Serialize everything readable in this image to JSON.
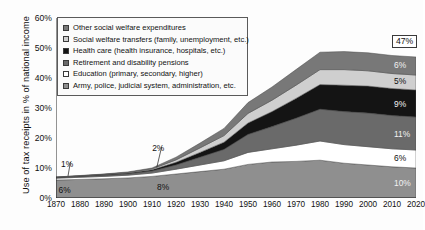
{
  "chart_data": {
    "type": "area",
    "title": "",
    "xlabel": "",
    "ylabel": "Use of tax receipts in % of national income",
    "xlim": [
      1870,
      2020
    ],
    "ylim": [
      0,
      60
    ],
    "grid": false,
    "legend_position": "upper-left-inside",
    "stacked": true,
    "x": [
      1870,
      1880,
      1890,
      1900,
      1910,
      1920,
      1930,
      1940,
      1950,
      1960,
      1970,
      1980,
      1990,
      2000,
      2010,
      2020
    ],
    "xtick_labels": [
      "1870",
      "1880",
      "1890",
      "1900",
      "1910",
      "1920",
      "1930",
      "1940",
      "1950",
      "1960",
      "1970",
      "1980",
      "1990",
      "2000",
      "2010",
      "2020"
    ],
    "ytick_labels": [
      "0%",
      "10%",
      "20%",
      "30%",
      "40%",
      "50%",
      "60%"
    ],
    "ytick_values": [
      0,
      10,
      20,
      30,
      40,
      50,
      60
    ],
    "series": [
      {
        "name": "Army, police, judicial system, administration, etc.",
        "color": "#8f8f8f",
        "values": [
          6.0,
          6.2,
          6.4,
          6.7,
          7.2,
          8.0,
          8.8,
          9.6,
          11.2,
          12.0,
          12.2,
          12.6,
          11.6,
          11.0,
          10.4,
          10.0
        ]
      },
      {
        "name": "Education (primary, secondary, higher)",
        "color": "#ffffff",
        "values": [
          0.6,
          0.7,
          0.8,
          0.9,
          1.1,
          1.6,
          2.2,
          2.8,
          4.0,
          4.4,
          5.4,
          6.4,
          6.2,
          6.1,
          6.0,
          6.0
        ]
      },
      {
        "name": "Retirement and disability pensions",
        "color": "#6a6a6a",
        "values": [
          0.2,
          0.3,
          0.4,
          0.5,
          0.7,
          1.4,
          2.6,
          3.8,
          6.0,
          7.4,
          9.0,
          10.6,
          11.0,
          11.2,
          11.1,
          11.0
        ]
      },
      {
        "name": "Health care (health insurance, hospitals, etc.)",
        "color": "#141414",
        "values": [
          0.1,
          0.1,
          0.2,
          0.2,
          0.4,
          0.9,
          1.6,
          2.4,
          3.8,
          5.0,
          6.6,
          8.2,
          8.8,
          9.0,
          9.0,
          9.0
        ]
      },
      {
        "name": "Social welfare transfers (family, unemployment, etc.)",
        "color": "#cfcfcf",
        "values": [
          0.05,
          0.1,
          0.1,
          0.2,
          0.3,
          0.8,
          1.5,
          2.2,
          3.2,
          3.8,
          4.4,
          5.0,
          5.2,
          5.1,
          5.0,
          5.0
        ]
      },
      {
        "name": "Other social welfare expenditures",
        "color": "#787878",
        "values": [
          0.05,
          0.1,
          0.1,
          0.2,
          0.3,
          0.9,
          1.6,
          2.4,
          3.6,
          4.4,
          5.2,
          5.8,
          6.0,
          6.0,
          6.0,
          6.0
        ]
      }
    ],
    "totals": [
      7.0,
      7.5,
      8.0,
      8.7,
      10.0,
      13.6,
      18.3,
      23.2,
      31.8,
      37.0,
      42.8,
      47.6,
      48.8,
      48.4,
      47.5,
      47.0
    ],
    "annotations": [
      {
        "name": "left-total-1875",
        "text": "1%",
        "x": 1875,
        "y": 11.5
      },
      {
        "name": "left-base-1875",
        "text": "6%",
        "x": 1874,
        "y": 2.6
      },
      {
        "name": "left-total-1910",
        "text": "2%",
        "x": 1913,
        "y": 16.8
      },
      {
        "name": "left-base-1910",
        "text": "8%",
        "x": 1915,
        "y": 3.6
      },
      {
        "name": "total-2020-boxed",
        "text": "47%",
        "x": 2020,
        "y": 52.5,
        "boxed": true
      },
      {
        "name": "band-other-2020",
        "text": "6%",
        "x": 2020,
        "y": 44.5
      },
      {
        "name": "band-transfers-2020",
        "text": "5%",
        "x": 2020,
        "y": 39.0
      },
      {
        "name": "band-health-2020",
        "text": "9%",
        "x": 2020,
        "y": 31.5
      },
      {
        "name": "band-pensions-2020",
        "text": "11%",
        "x": 2020,
        "y": 21.5
      },
      {
        "name": "band-education-2020",
        "text": "6%",
        "x": 2020,
        "y": 13.2
      },
      {
        "name": "band-army-2020",
        "text": "10%",
        "x": 2020,
        "y": 5.0
      }
    ]
  },
  "legend": {
    "items": [
      {
        "label": "Other social welfare expenditures",
        "color": "#787878"
      },
      {
        "label": "Social welfare transfers (family, unemployment, etc.)",
        "color": "#cfcfcf"
      },
      {
        "label": "Health care (health insurance, hospitals, etc.)",
        "color": "#141414"
      },
      {
        "label": "Retirement and disability pensions",
        "color": "#6a6a6a"
      },
      {
        "label": "Education (primary, secondary, higher)",
        "color": "#ffffff"
      },
      {
        "label": "Army, police, judicial system, administration, etc.",
        "color": "#8f8f8f"
      }
    ]
  }
}
